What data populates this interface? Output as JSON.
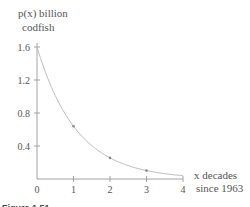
{
  "chart_data": {
    "type": "line",
    "title": "",
    "ylabel_line1": "p(x) billion",
    "ylabel_line2": "codfish",
    "xlabel_line1": "x decades",
    "xlabel_line2": "since 1963",
    "xlim": [
      0,
      4
    ],
    "ylim": [
      0,
      1.6
    ],
    "xticks": [
      0,
      1,
      2,
      3,
      4
    ],
    "xtick_labels": [
      "0",
      "1",
      "2",
      "3",
      "4"
    ],
    "yticks": [
      0.4,
      0.8,
      1.2,
      1.6
    ],
    "ytick_labels": [
      "0.4",
      "0.8",
      "1.2",
      "1.6"
    ],
    "grid": false,
    "series": [
      {
        "name": "p(x) = 1.6(0.4)^x",
        "function": {
          "a": 1.6,
          "b": 0.4
        },
        "points": [
          {
            "x": 0,
            "y": 1.6
          },
          {
            "x": 1,
            "y": 0.64
          },
          {
            "x": 2,
            "y": 0.256
          },
          {
            "x": 3,
            "y": 0.102
          },
          {
            "x": 4,
            "y": 0.041
          }
        ]
      }
    ],
    "caption": "Figure 1.51"
  }
}
